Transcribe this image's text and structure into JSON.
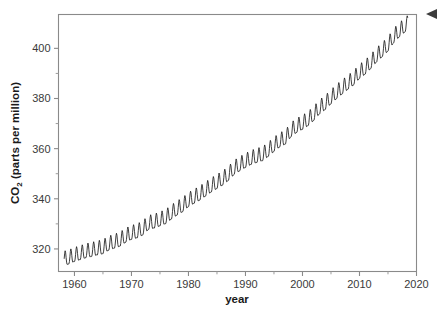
{
  "figure": {
    "background_color": "#ffffff",
    "frame_color": "#8a8a8a",
    "line_color": "#1c1c1c"
  },
  "cursor": {
    "name": "left-pointing-arrow-cursor",
    "x": 437,
    "y": 14
  },
  "axis_titles": {
    "y_main": "CO",
    "y_sub": "2",
    "y_rest": " (parts per million)",
    "y_full": "CO2 (parts per million)",
    "x": "year"
  },
  "chart_data": {
    "type": "line",
    "title": "",
    "subtitle": "",
    "xlabel": "year",
    "ylabel": "CO2 (parts per million)",
    "xlim": [
      1957.2,
      2020.0
    ],
    "ylim": [
      311.0,
      413.5
    ],
    "grid": false,
    "legend": null,
    "legend_position": "none",
    "x_ticks_major": [
      1960,
      1970,
      1980,
      1990,
      2000,
      2010,
      2020
    ],
    "x_tick_labels": [
      "1960",
      "1970",
      "1980",
      "1990",
      "2000",
      "2010",
      "2020"
    ],
    "x_ticks_minor": [
      1965,
      1975,
      1985,
      1995,
      2005,
      2015
    ],
    "y_ticks_major": [
      320,
      340,
      360,
      380,
      400
    ],
    "y_tick_labels": [
      "320",
      "340",
      "360",
      "380",
      "400"
    ],
    "y_ticks_minor": [
      330,
      350,
      370,
      390
    ],
    "series": [
      {
        "name": "Atmospheric CO2 (Mauna Loa monthly mean)",
        "color": "#1c1c1c",
        "seasonal_amplitude_ppm": 3.0,
        "annual_trend": {
          "x": [
            1958,
            1959,
            1960,
            1961,
            1962,
            1963,
            1964,
            1965,
            1966,
            1967,
            1968,
            1969,
            1970,
            1971,
            1972,
            1973,
            1974,
            1975,
            1976,
            1977,
            1978,
            1979,
            1980,
            1981,
            1982,
            1983,
            1984,
            1985,
            1986,
            1987,
            1988,
            1989,
            1990,
            1991,
            1992,
            1993,
            1994,
            1995,
            1996,
            1997,
            1998,
            1999,
            2000,
            2001,
            2002,
            2003,
            2004,
            2005,
            2006,
            2007,
            2008,
            2009,
            2010,
            2011,
            2012,
            2013,
            2014,
            2015,
            2016,
            2017,
            2018
          ],
          "y": [
            315.3,
            315.9,
            316.9,
            317.6,
            318.4,
            318.9,
            319.5,
            320.0,
            321.4,
            322.2,
            323.0,
            324.6,
            325.7,
            326.3,
            327.5,
            329.7,
            330.2,
            331.1,
            332.0,
            333.8,
            335.4,
            336.8,
            338.8,
            340.1,
            341.4,
            343.0,
            344.6,
            346.0,
            347.4,
            349.2,
            351.6,
            353.1,
            354.4,
            355.6,
            356.4,
            357.1,
            358.8,
            360.8,
            362.6,
            363.7,
            366.7,
            368.4,
            369.6,
            371.1,
            373.2,
            375.8,
            377.5,
            379.8,
            381.9,
            383.8,
            385.6,
            387.4,
            389.9,
            391.6,
            393.9,
            396.5,
            398.6,
            400.8,
            404.2,
            406.5,
            408.5
          ]
        }
      }
    ]
  }
}
